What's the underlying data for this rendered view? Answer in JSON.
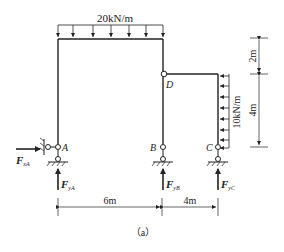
{
  "figure": {
    "caption": "（a）",
    "colors": {
      "line": "#222222",
      "background": "#ffffff"
    }
  },
  "loads": {
    "top_udl": {
      "label": "20kN/m",
      "direction": "down",
      "arrow_count": 7
    },
    "side_udl": {
      "label": "10kN/m",
      "direction": "left",
      "arrow_count": 8
    }
  },
  "nodes": {
    "A": {
      "label": "A"
    },
    "B": {
      "label": "B"
    },
    "C": {
      "label": "C"
    },
    "D": {
      "label": "D"
    }
  },
  "reactions": {
    "FxA": {
      "main": "F",
      "sub": "xA"
    },
    "FyA": {
      "main": "F",
      "sub": "yA"
    },
    "FyB": {
      "main": "F",
      "sub": "yB"
    },
    "FyC": {
      "main": "F",
      "sub": "yC"
    }
  },
  "dimensions": {
    "horizontal": [
      "6m",
      "4m"
    ],
    "vertical": [
      "2m",
      "4m"
    ]
  }
}
